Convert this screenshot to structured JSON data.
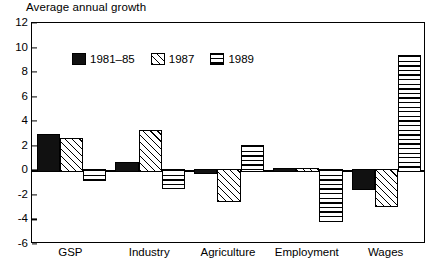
{
  "chart_data": {
    "type": "bar",
    "title": "Average annual growth",
    "xlabel": "",
    "ylabel": "",
    "ylim": [
      -6,
      12
    ],
    "ytick_step": 2,
    "yticks": [
      12,
      10,
      8,
      6,
      4,
      2,
      0,
      -2,
      -4,
      -6
    ],
    "grid": false,
    "legend_position": "top-left inside plot",
    "categories": [
      "GSP",
      "Industry",
      "Agriculture",
      "Employment",
      "Wages"
    ],
    "series": [
      {
        "name": "1981–85",
        "fill": "solid-black",
        "values": [
          3.0,
          0.7,
          -0.3,
          0.15,
          -1.6
        ]
      },
      {
        "name": "1987",
        "fill": "diagonal-hatch",
        "values": [
          2.6,
          3.3,
          -2.6,
          0.2,
          -3.0
        ]
      },
      {
        "name": "1989",
        "fill": "horizontal-lines",
        "values": [
          -0.9,
          -1.5,
          2.1,
          -4.2,
          9.4
        ]
      }
    ]
  },
  "colors": {
    "ink": "#000000",
    "background": "#ffffff",
    "solid_bar": "#111111"
  }
}
